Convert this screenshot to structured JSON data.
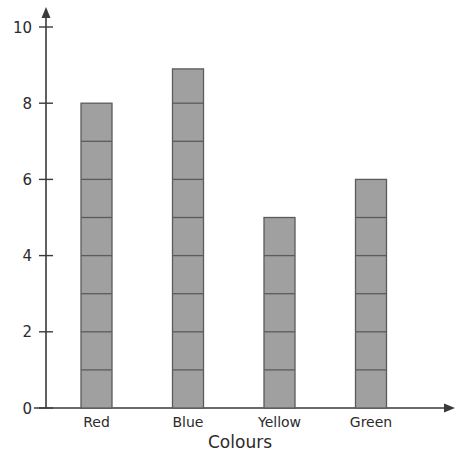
{
  "chart_data": {
    "type": "bar",
    "title": "",
    "subtitle": "",
    "categories": [
      "Red",
      "Blue",
      "Yellow",
      "Green"
    ],
    "values": [
      8,
      8.9,
      5,
      6
    ],
    "xlabel": "Colours",
    "ylabel": "",
    "ylim": [
      0,
      10
    ],
    "ytick_labels": [
      "0",
      "2",
      "4",
      "6",
      "8",
      "10"
    ],
    "ytick_values": [
      0,
      2,
      4,
      6,
      8,
      10
    ],
    "grid": false,
    "legend": null,
    "annotations": [],
    "bar_fill_color": "#a0a0a0",
    "bar_edge_color": "#5b5b5b",
    "axis_color": "#3a3a3a",
    "segment_unit": 1
  },
  "axis": {
    "y_arrow": "arrow-up-icon",
    "x_arrow": "arrow-right-icon"
  }
}
